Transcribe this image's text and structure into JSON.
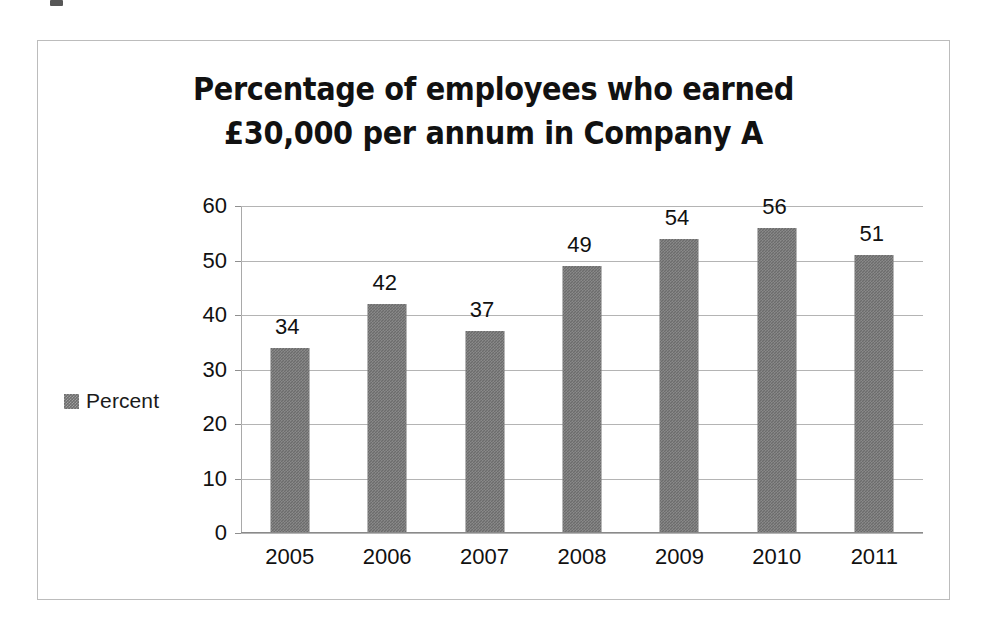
{
  "chart_data": {
    "type": "bar",
    "title": "Percentage of employees who earned £30,000 per annum in Company A",
    "title_lines": [
      "Percentage of employees who earned",
      "£30,000 per annum in Company A"
    ],
    "categories": [
      "2005",
      "2006",
      "2007",
      "2008",
      "2009",
      "2010",
      "2011"
    ],
    "values": [
      34,
      42,
      37,
      49,
      54,
      56,
      51
    ],
    "value_labels": [
      "34",
      "42",
      "37",
      "49",
      "54",
      "56",
      "51"
    ],
    "series": [
      {
        "name": "Percent",
        "values": [
          34,
          42,
          37,
          49,
          54,
          56,
          51
        ]
      }
    ],
    "legend": {
      "position": "left",
      "entries": [
        "Percent"
      ]
    },
    "xlabel": "",
    "ylabel": "",
    "ylim": [
      0,
      60
    ],
    "ytick_labels": [
      "0",
      "10",
      "20",
      "30",
      "40",
      "50",
      "60"
    ],
    "ytick_values": [
      0,
      10,
      20,
      30,
      40,
      50,
      60
    ],
    "grid": true,
    "data_labels": true,
    "colors": {
      "bar": "#6c6c6c",
      "gridline": "#b4b4b4",
      "axis": "#8f8f8f",
      "border": "#bcbcbc",
      "background": "#ffffff",
      "text": "#111111"
    }
  },
  "legend": {
    "label": "Percent"
  }
}
